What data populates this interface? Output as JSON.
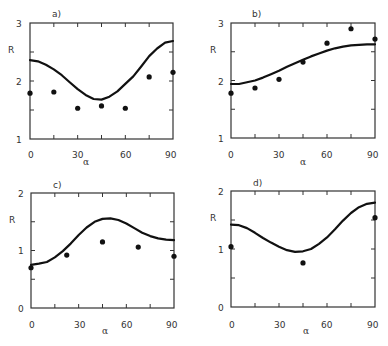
{
  "chart_data": [
    {
      "type": "line",
      "panel": "a)",
      "title": "a)",
      "xlabel": "α",
      "ylabel": "R",
      "xlim": [
        0,
        90
      ],
      "ylim": [
        1,
        3
      ],
      "xticks": [
        0,
        30,
        60,
        90
      ],
      "yticks": [
        1,
        2,
        3
      ],
      "grid": false,
      "series": [
        {
          "name": "model",
          "kind": "line",
          "x": [
            0,
            5,
            10,
            15,
            20,
            25,
            30,
            35,
            40,
            45,
            50,
            55,
            60,
            65,
            70,
            75,
            80,
            85,
            90
          ],
          "y": [
            2.36,
            2.34,
            2.28,
            2.2,
            2.1,
            1.98,
            1.86,
            1.76,
            1.69,
            1.68,
            1.73,
            1.82,
            1.95,
            2.08,
            2.25,
            2.43,
            2.56,
            2.66,
            2.69
          ]
        },
        {
          "name": "data",
          "kind": "scatter",
          "x": [
            0,
            15,
            30,
            45,
            60,
            75,
            90
          ],
          "y": [
            1.79,
            1.81,
            1.53,
            1.57,
            1.53,
            2.07,
            2.15
          ]
        }
      ]
    },
    {
      "type": "line",
      "panel": "b)",
      "title": "b)",
      "xlabel": "α",
      "ylabel": "R",
      "xlim": [
        0,
        90
      ],
      "ylim": [
        1,
        3
      ],
      "xticks": [
        0,
        30,
        60,
        90
      ],
      "yticks": [
        1,
        2,
        3
      ],
      "grid": false,
      "series": [
        {
          "name": "model",
          "kind": "line",
          "x": [
            0,
            5,
            10,
            15,
            20,
            25,
            30,
            35,
            40,
            45,
            50,
            55,
            60,
            65,
            70,
            75,
            80,
            85,
            90
          ],
          "y": [
            1.94,
            1.94,
            1.97,
            2.0,
            2.05,
            2.11,
            2.17,
            2.24,
            2.3,
            2.36,
            2.42,
            2.47,
            2.52,
            2.56,
            2.59,
            2.61,
            2.62,
            2.63,
            2.63
          ]
        },
        {
          "name": "data",
          "kind": "scatter",
          "x": [
            0,
            15,
            30,
            45,
            60,
            75,
            90
          ],
          "y": [
            1.78,
            1.87,
            2.02,
            2.32,
            2.65,
            2.9,
            2.72
          ]
        }
      ]
    },
    {
      "type": "line",
      "panel": "c)",
      "title": "c)",
      "xlabel": "α",
      "ylabel": "R",
      "xlim": [
        0,
        90
      ],
      "ylim": [
        0,
        2
      ],
      "xticks": [
        0,
        30,
        60,
        90
      ],
      "yticks": [
        0,
        1,
        2
      ],
      "grid": false,
      "series": [
        {
          "name": "model",
          "kind": "line",
          "x": [
            0,
            5,
            10,
            15,
            20,
            25,
            30,
            35,
            40,
            45,
            50,
            55,
            60,
            65,
            70,
            75,
            80,
            85,
            90
          ],
          "y": [
            0.75,
            0.77,
            0.8,
            0.88,
            0.99,
            1.12,
            1.27,
            1.4,
            1.5,
            1.55,
            1.56,
            1.53,
            1.47,
            1.39,
            1.31,
            1.25,
            1.21,
            1.19,
            1.18
          ]
        },
        {
          "name": "data",
          "kind": "scatter",
          "x": [
            0,
            22.5,
            45,
            67.5,
            90
          ],
          "y": [
            0.7,
            0.92,
            1.15,
            1.06,
            0.9
          ]
        }
      ]
    },
    {
      "type": "line",
      "panel": "d)",
      "title": "d)",
      "xlabel": "α",
      "ylabel": "R",
      "xlim": [
        0,
        90
      ],
      "ylim": [
        0,
        2
      ],
      "xticks": [
        0,
        30,
        60,
        90
      ],
      "yticks": [
        0,
        1,
        2
      ],
      "grid": false,
      "series": [
        {
          "name": "model",
          "kind": "line",
          "x": [
            0,
            5,
            10,
            15,
            20,
            25,
            30,
            35,
            40,
            45,
            50,
            55,
            60,
            65,
            70,
            75,
            80,
            85,
            90
          ],
          "y": [
            1.42,
            1.41,
            1.36,
            1.28,
            1.19,
            1.11,
            1.04,
            0.98,
            0.95,
            0.96,
            1.0,
            1.09,
            1.2,
            1.34,
            1.49,
            1.62,
            1.72,
            1.78,
            1.8
          ]
        },
        {
          "name": "data",
          "kind": "scatter",
          "x": [
            0,
            45,
            90
          ],
          "y": [
            1.04,
            0.76,
            1.54
          ]
        }
      ]
    }
  ],
  "panels": [
    {
      "label": "a)",
      "ylabel": "R",
      "xlabel": "α",
      "xtick_labels": [
        "0",
        "30",
        "60",
        "90"
      ],
      "ytick_labels": [
        "1",
        "2",
        "3"
      ]
    },
    {
      "label": "b)",
      "ylabel": "R",
      "xlabel": "α",
      "xtick_labels": [
        "0",
        "30",
        "60",
        "90"
      ],
      "ytick_labels": [
        "1",
        "2",
        "3"
      ]
    },
    {
      "label": "c)",
      "ylabel": "R",
      "xlabel": "α",
      "xtick_labels": [
        "0",
        "30",
        "60",
        "90"
      ],
      "ytick_labels": [
        "0",
        "1",
        "2"
      ]
    },
    {
      "label": "d)",
      "ylabel": "R",
      "xlabel": "α",
      "xtick_labels": [
        "0",
        "30",
        "60",
        "90"
      ],
      "ytick_labels": [
        "0",
        "1",
        "2"
      ]
    }
  ]
}
